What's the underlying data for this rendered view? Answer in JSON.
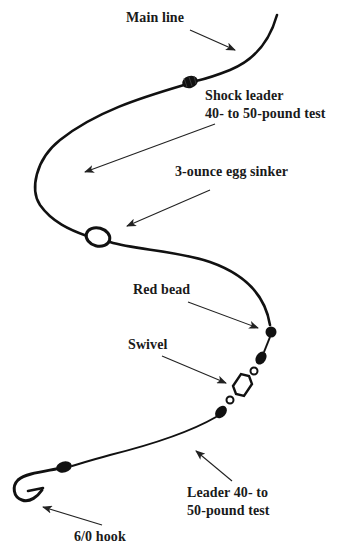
{
  "diagram": {
    "type": "fishing-rig",
    "colors": {
      "line": "#111111",
      "arrow": "#222222",
      "background": "#ffffff",
      "text": "#1a1a1a"
    },
    "labels": {
      "main_line": "Main line",
      "shock_leader_line1": "Shock leader",
      "shock_leader_line2": "40- to 50-pound test",
      "egg_sinker": "3-ounce egg sinker",
      "red_bead": "Red bead",
      "swivel": "Swivel",
      "leader_line1": "Leader 40- to",
      "leader_line2": "50-pound test",
      "hook": "6/0 hook"
    },
    "components": [
      {
        "name": "Main line"
      },
      {
        "name": "Knot (main line to shock leader)"
      },
      {
        "name": "Shock leader",
        "spec": "40- to 50-pound test"
      },
      {
        "name": "Egg sinker",
        "spec": "3-ounce"
      },
      {
        "name": "Red bead"
      },
      {
        "name": "Swivel"
      },
      {
        "name": "Leader",
        "spec": "40- to 50-pound test"
      },
      {
        "name": "Hook",
        "spec": "6/0"
      }
    ]
  }
}
